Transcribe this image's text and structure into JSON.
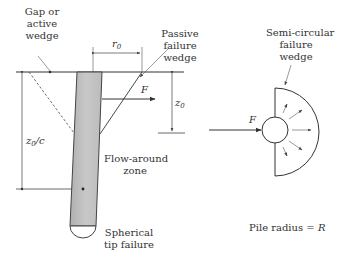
{
  "left_figure": {
    "gap_label": [
      "Gap or",
      "active",
      "wedge"
    ],
    "passive_label": [
      "Passive",
      "failure",
      "wedge"
    ],
    "r0_label": "r",
    "r0_sub": "0",
    "force_label": "F",
    "z0_label": "z",
    "z0_sub": "0",
    "z0c_label": "z",
    "z0c_sub": "0",
    "z0c_suffix": "/c",
    "flow_label": [
      "Flow-around",
      "zone"
    ],
    "tip_label": [
      "Spherical",
      "tip failure"
    ]
  },
  "right_figure": {
    "semi_label": [
      "Semi-circular",
      "failure",
      "wedge"
    ],
    "force_label": "F",
    "radius_label": "Pile radius = ",
    "radius_symbol": "R"
  },
  "colors": {
    "line": "#333333",
    "pile_fill": "#bdbdbd",
    "pile_edge": "#444444"
  }
}
